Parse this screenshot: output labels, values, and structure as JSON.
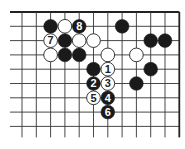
{
  "diagram": {
    "type": "go-board-fragment",
    "grid": {
      "columns": 12,
      "rows": 9,
      "x0": 22,
      "y0": 12,
      "spacing_x": 14.3,
      "spacing_y": 14.3,
      "top_edge": true,
      "right_edge": true,
      "left_edge": false,
      "bottom_edge": false,
      "line_color": "#333333",
      "edge_color": "#222222"
    },
    "colors": {
      "black_stone": "#1a1a1a",
      "white_stone": "#ffffff",
      "stone_outline": "#222222",
      "black_label": "#ffffff",
      "white_label": "#222222"
    },
    "stones": [
      {
        "col": 2,
        "row": 1,
        "color": "black",
        "label": ""
      },
      {
        "col": 3,
        "row": 1,
        "color": "white",
        "label": ""
      },
      {
        "col": 4,
        "row": 1,
        "color": "black",
        "label": "8"
      },
      {
        "col": 7,
        "row": 1,
        "color": "black",
        "label": ""
      },
      {
        "col": 2,
        "row": 2,
        "color": "white",
        "label": "7"
      },
      {
        "col": 3,
        "row": 2,
        "color": "black",
        "label": ""
      },
      {
        "col": 4,
        "row": 2,
        "color": "white",
        "label": ""
      },
      {
        "col": 5,
        "row": 2,
        "color": "white",
        "label": ""
      },
      {
        "col": 9,
        "row": 2,
        "color": "black",
        "label": ""
      },
      {
        "col": 10,
        "row": 2,
        "color": "black",
        "label": ""
      },
      {
        "col": 2,
        "row": 3,
        "color": "white",
        "label": ""
      },
      {
        "col": 3,
        "row": 3,
        "color": "black",
        "label": ""
      },
      {
        "col": 4,
        "row": 3,
        "color": "black",
        "label": ""
      },
      {
        "col": 6,
        "row": 3,
        "color": "white",
        "label": ""
      },
      {
        "col": 8,
        "row": 3,
        "color": "white",
        "label": ""
      },
      {
        "col": 5,
        "row": 4,
        "color": "black",
        "label": ""
      },
      {
        "col": 6,
        "row": 4,
        "color": "white",
        "label": "1"
      },
      {
        "col": 9,
        "row": 4,
        "color": "black",
        "label": ""
      },
      {
        "col": 5,
        "row": 5,
        "color": "black",
        "label": "2"
      },
      {
        "col": 6,
        "row": 5,
        "color": "white",
        "label": "3"
      },
      {
        "col": 8,
        "row": 5,
        "color": "black",
        "label": ""
      },
      {
        "col": 5,
        "row": 6,
        "color": "white",
        "label": "5"
      },
      {
        "col": 6,
        "row": 6,
        "color": "black",
        "label": "4"
      },
      {
        "col": 6,
        "row": 7,
        "color": "black",
        "label": "6"
      }
    ]
  }
}
